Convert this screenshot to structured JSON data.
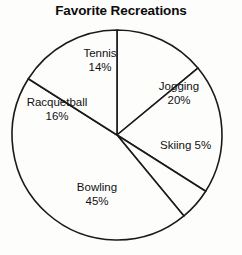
{
  "chart_data": {
    "type": "pie",
    "title": "Favorite Recreations",
    "labels": [
      "Tennis",
      "Jogging",
      "Skiing",
      "Bowling",
      "Racquetball"
    ],
    "values": [
      14,
      20,
      5,
      45,
      16
    ],
    "unit": "%",
    "legend": "none",
    "grid": false,
    "slices": [
      {
        "label": "Tennis",
        "value": 14,
        "percent_text": "14%",
        "start_angle_deg": 0,
        "end_angle_deg": 50.4,
        "label_layout": "two-line"
      },
      {
        "label": "Jogging",
        "value": 20,
        "percent_text": "20%",
        "start_angle_deg": 50.4,
        "end_angle_deg": 122.4,
        "label_layout": "two-line"
      },
      {
        "label": "Skiing",
        "value": 5,
        "percent_text": "5%",
        "start_angle_deg": 122.4,
        "end_angle_deg": 140.4,
        "label_layout": "inline"
      },
      {
        "label": "Bowling",
        "value": 45,
        "percent_text": "45%",
        "start_angle_deg": 140.4,
        "end_angle_deg": 302.4,
        "label_layout": "two-line"
      },
      {
        "label": "Racquetball",
        "value": 16,
        "percent_text": "16%",
        "start_angle_deg": 302.4,
        "end_angle_deg": 360,
        "label_layout": "two-line"
      }
    ],
    "geometry": {
      "center_x": 117,
      "center_y": 135,
      "radius": 105,
      "start_at": "12-o-clock",
      "direction": "clockwise"
    },
    "colors": {
      "slice_fill": "#fdfdfc",
      "outline": "#1a1a1a",
      "text": "#111111",
      "background": "#fdfdfc"
    }
  }
}
